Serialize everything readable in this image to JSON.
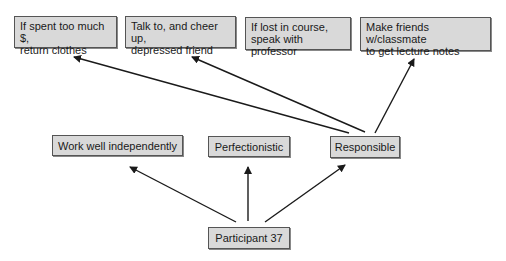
{
  "diagram": {
    "root": {
      "id": "participant",
      "label": "Participant 37"
    },
    "traits": [
      {
        "id": "work-well",
        "label": "Work well independently"
      },
      {
        "id": "perfectionistic",
        "label": "Perfectionistic"
      },
      {
        "id": "responsible",
        "label": "Responsible"
      }
    ],
    "behaviors": [
      {
        "id": "b1",
        "line1": "If spent too much $,",
        "line2": "return clothes"
      },
      {
        "id": "b2",
        "line1": "Talk to, and cheer up,",
        "line2": "depressed friend"
      },
      {
        "id": "b3",
        "line1": "If lost in course,",
        "line2": "speak with professor"
      },
      {
        "id": "b4",
        "line1": "Make friends w/classmate",
        "line2": "to get lecture notes"
      }
    ],
    "edges": [
      {
        "from": "participant",
        "to": "work-well"
      },
      {
        "from": "participant",
        "to": "perfectionistic"
      },
      {
        "from": "participant",
        "to": "responsible"
      },
      {
        "from": "responsible",
        "to": "b1"
      },
      {
        "from": "responsible",
        "to": "b2"
      },
      {
        "from": "responsible",
        "to": "b4"
      }
    ],
    "colors": {
      "box_fill": "#d9d9d9",
      "box_border": "#555555",
      "arrow": "#1a1a1a"
    }
  }
}
